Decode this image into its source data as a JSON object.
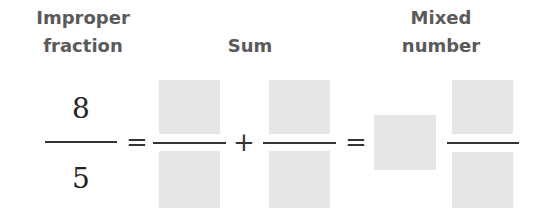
{
  "labels": {
    "improper": [
      "Improper",
      "fraction"
    ],
    "sum": "Sum",
    "mixed": [
      "Mixed",
      "number"
    ]
  },
  "equation": {
    "improper_fraction": {
      "numerator": "8",
      "denominator": "5"
    },
    "equals_1": "=",
    "sum_term_1": {
      "numerator": "",
      "denominator": ""
    },
    "plus": "+",
    "sum_term_2": {
      "numerator": "",
      "denominator": ""
    },
    "equals_2": "=",
    "mixed_number": {
      "whole": "",
      "numerator": "",
      "denominator": ""
    }
  },
  "colors": {
    "answer_box": "#e6e6e6",
    "label_text": "#5a5a5a"
  }
}
